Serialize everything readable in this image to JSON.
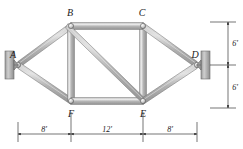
{
  "figure": {
    "type": "engineering-truss-diagram"
  },
  "nodes": [
    {
      "id": "A",
      "label": "A",
      "x": 18,
      "y": 65
    },
    {
      "id": "B",
      "label": "B",
      "x": 71,
      "y": 26
    },
    {
      "id": "C",
      "label": "C",
      "x": 143,
      "y": 26
    },
    {
      "id": "D",
      "label": "D",
      "x": 197,
      "y": 65
    },
    {
      "id": "E",
      "label": "E",
      "x": 143,
      "y": 101
    },
    {
      "id": "F",
      "label": "F",
      "x": 71,
      "y": 101
    }
  ],
  "members": [
    {
      "from": "A",
      "to": "B"
    },
    {
      "from": "A",
      "to": "F"
    },
    {
      "from": "B",
      "to": "F"
    },
    {
      "from": "B",
      "to": "C"
    },
    {
      "from": "B",
      "to": "E"
    },
    {
      "from": "C",
      "to": "E"
    },
    {
      "from": "C",
      "to": "D"
    },
    {
      "from": "E",
      "to": "D"
    },
    {
      "from": "F",
      "to": "E"
    }
  ],
  "supports": [
    {
      "at": "A",
      "kind": "pin-on-wall",
      "side": "left"
    },
    {
      "at": "D",
      "kind": "pin-on-wall",
      "side": "right"
    }
  ],
  "dimensions": {
    "horizontal": [
      {
        "label": "8'",
        "from": "A",
        "to": "F"
      },
      {
        "label": "12'",
        "from": "F",
        "to": "E"
      },
      {
        "label": "8'",
        "from": "E",
        "to": "D"
      }
    ],
    "vertical": [
      {
        "label": "6'",
        "span": "top"
      },
      {
        "label": "6'",
        "span": "bottom"
      }
    ]
  },
  "colors": {
    "member_fill_light": "#d8d8d8",
    "member_fill_mid": "#b4b4b4",
    "member_fill_dark": "#8e8e8e",
    "member_stroke": "#6b6b6b",
    "wall_fill": "#b8b8b8",
    "wall_stroke": "#6b6b6b",
    "text": "#1a1a1a"
  }
}
